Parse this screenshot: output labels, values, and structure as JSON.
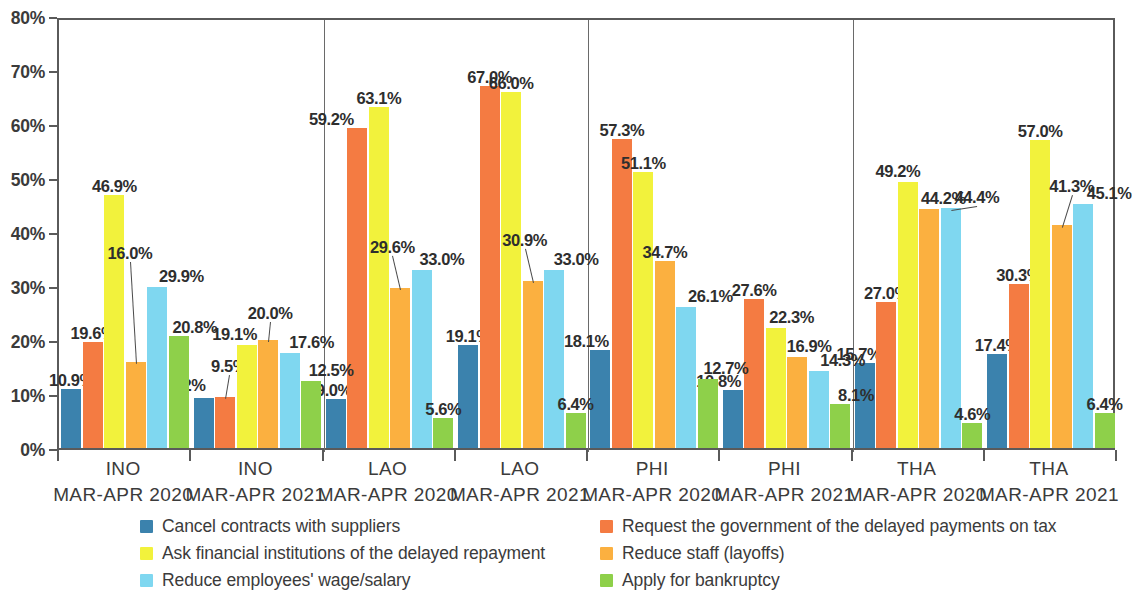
{
  "chart_data": {
    "type": "bar",
    "title": "",
    "subtitle": "",
    "xlabel": "",
    "ylabel": "",
    "ylim": [
      0,
      80
    ],
    "y_ticks": [
      "0%",
      "10%",
      "20%",
      "30%",
      "40%",
      "50%",
      "60%",
      "70%",
      "80%"
    ],
    "y_tick_values": [
      0,
      10,
      20,
      30,
      40,
      50,
      60,
      70,
      80
    ],
    "grid": false,
    "legend_position": "bottom",
    "value_suffix": "%",
    "categories": [
      "INO MAR-APR 2020",
      "INO MAR-APR 2021",
      "LAO MAR-APR 2020",
      "LAO MAR-APR 2021",
      "PHI MAR-APR 2020",
      "PHI MAR-APR 2021",
      "THA MAR-APR 2020",
      "THA MAR-APR 2021"
    ],
    "category_lines": [
      {
        "country": "INO",
        "period": "MAR-APR 2020"
      },
      {
        "country": "INO",
        "period": "MAR-APR 2021"
      },
      {
        "country": "LAO",
        "period": "MAR-APR 2020"
      },
      {
        "country": "LAO",
        "period": "MAR-APR 2021"
      },
      {
        "country": "PHI",
        "period": "MAR-APR 2020"
      },
      {
        "country": "PHI",
        "period": "MAR-APR 2021"
      },
      {
        "country": "THA",
        "period": "MAR-APR 2020"
      },
      {
        "country": "THA",
        "period": "MAR-APR 2021"
      }
    ],
    "series": [
      {
        "name": "Cancel contracts with suppliers",
        "color": "#3b82ad",
        "values": [
          10.9,
          9.2,
          9.0,
          19.1,
          18.1,
          10.8,
          15.7,
          17.4
        ],
        "labels": [
          "10.9%",
          "9.2%",
          "9.0%",
          "19.1%",
          "18.1%",
          "10.8%",
          "15.7%",
          "17.4%"
        ]
      },
      {
        "name": "Request the government of the delayed payments on tax",
        "color": "#f47b42",
        "values": [
          19.6,
          9.5,
          59.2,
          67.0,
          57.3,
          27.6,
          27.0,
          30.3
        ],
        "labels": [
          "19.6%",
          "9.5%",
          "59.2%",
          "67.0%",
          "57.3%",
          "27.6%",
          "27.0%",
          "30.3%"
        ]
      },
      {
        "name": "Ask financial institutions of the delayed repayment",
        "color": "#f2f23c",
        "values": [
          46.9,
          19.1,
          63.1,
          66.0,
          51.1,
          22.3,
          49.2,
          57.0
        ],
        "labels": [
          "46.9%",
          "19.1%",
          "63.1%",
          "66.0%",
          "51.1%",
          "22.3%",
          "49.2%",
          "57.0%"
        ]
      },
      {
        "name": "Reduce staff (layoffs)",
        "color": "#fbb040",
        "values": [
          16.0,
          20.0,
          29.6,
          30.9,
          34.7,
          16.9,
          44.2,
          41.3
        ],
        "labels": [
          "16.0%",
          "20.0%",
          "29.6%",
          "30.9%",
          "34.7%",
          "16.9%",
          "44.2%",
          "41.3%"
        ]
      },
      {
        "name": "Reduce employees' wage/salary",
        "color": "#7fd7f0",
        "values": [
          29.9,
          17.6,
          33.0,
          33.0,
          26.1,
          14.3,
          44.4,
          45.1
        ],
        "labels": [
          "29.9%",
          "17.6%",
          "33.0%",
          "33.0%",
          "26.1%",
          "14.3%",
          "44.4%",
          "45.1%"
        ]
      },
      {
        "name": "Apply for bankruptcy",
        "color": "#8ed04a",
        "values": [
          20.8,
          12.5,
          5.6,
          6.4,
          12.7,
          8.1,
          4.6,
          6.4
        ],
        "labels": [
          "20.8%",
          "12.5%",
          "5.6%",
          "6.4%",
          "12.7%",
          "8.1%",
          "4.6%",
          "6.4%"
        ]
      }
    ],
    "legend": [
      {
        "label": "Cancel contracts with suppliers",
        "color": "#3b82ad",
        "col": 0,
        "row": 0
      },
      {
        "label": "Request the government of the delayed payments on tax",
        "color": "#f47b42",
        "col": 1,
        "row": 0
      },
      {
        "label": "Ask financial institutions of the delayed repayment",
        "color": "#f2f23c",
        "col": 0,
        "row": 1
      },
      {
        "label": "Reduce staff (layoffs)",
        "color": "#fbb040",
        "col": 1,
        "row": 1
      },
      {
        "label": "Reduce employees' wage/salary",
        "color": "#7fd7f0",
        "col": 0,
        "row": 2
      },
      {
        "label": "Apply for bankruptcy",
        "color": "#8ed04a",
        "col": 1,
        "row": 2
      }
    ]
  }
}
